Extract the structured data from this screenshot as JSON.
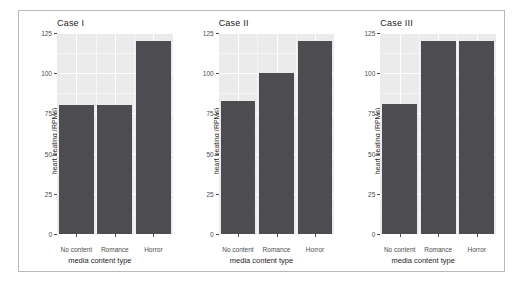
{
  "figure": {
    "background_color": "#ffffff",
    "frame_color": "#b9b9b9",
    "panel_background_color": "#ebebeb",
    "gridline_color": "#ffffff",
    "bar_color": "#4c4c51",
    "axis_text_color": "#4d4d4d"
  },
  "chart_data": {
    "type": "bar",
    "title": "",
    "xlabel": "media content type",
    "ylabel": "heart beating (RPMs)",
    "categories": [
      "No content",
      "Romance",
      "Horror"
    ],
    "ylim": [
      0,
      125
    ],
    "yticks": [
      0,
      25,
      50,
      75,
      100,
      125
    ],
    "ytick_labels": [
      "0",
      "25",
      "50",
      "75",
      "100",
      "125"
    ],
    "grid": true,
    "legend": "none",
    "facets": [
      {
        "label": "Case I",
        "values": [
          80,
          80,
          120
        ]
      },
      {
        "label": "Case II",
        "values": [
          83,
          100,
          120
        ]
      },
      {
        "label": "Case III",
        "values": [
          81,
          120,
          120
        ]
      }
    ]
  }
}
